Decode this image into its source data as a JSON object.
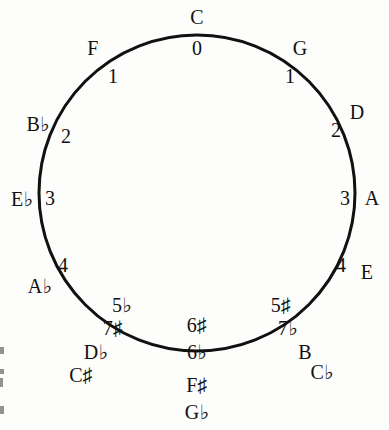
{
  "diagram": {
    "stroke_color": "#111111",
    "background_color": "#fdfdfb",
    "circle": {
      "center_x": 197,
      "center_y": 193,
      "radius": 158,
      "stroke_width": 3
    },
    "outer_labels": [
      {
        "text": "C",
        "x": 197,
        "y": 17,
        "name": "key-c"
      },
      {
        "text": "G",
        "x": 300,
        "y": 48,
        "name": "key-g"
      },
      {
        "text": "D",
        "x": 357,
        "y": 112,
        "name": "key-d"
      },
      {
        "text": "A",
        "x": 372,
        "y": 198,
        "name": "key-a"
      },
      {
        "text": "E",
        "x": 367,
        "y": 272,
        "name": "key-e"
      },
      {
        "text": "B",
        "x": 305,
        "y": 352,
        "name": "key-b"
      },
      {
        "text": "C♭",
        "x": 322,
        "y": 372,
        "name": "key-c-flat"
      },
      {
        "text": "F♯",
        "x": 197,
        "y": 385,
        "name": "key-f-sharp"
      },
      {
        "text": "G♭",
        "x": 197,
        "y": 412,
        "name": "key-g-flat"
      },
      {
        "text": "D♭",
        "x": 96,
        "y": 352,
        "name": "key-d-flat"
      },
      {
        "text": "C♯",
        "x": 81,
        "y": 375,
        "name": "key-c-sharp"
      },
      {
        "text": "A♭",
        "x": 40,
        "y": 286,
        "name": "key-a-flat"
      },
      {
        "text": "E♭",
        "x": 22,
        "y": 199,
        "name": "key-e-flat"
      },
      {
        "text": "B♭",
        "x": 38,
        "y": 124,
        "name": "key-b-flat"
      },
      {
        "text": "F",
        "x": 93,
        "y": 48,
        "name": "key-f"
      }
    ],
    "inner_labels": [
      {
        "text": "0",
        "x": 197,
        "y": 48,
        "name": "accidentals-0"
      },
      {
        "text": "1",
        "x": 290,
        "y": 76,
        "name": "accidentals-1-sharp"
      },
      {
        "text": "2",
        "x": 336,
        "y": 130,
        "name": "accidentals-2-sharp"
      },
      {
        "text": "3",
        "x": 345,
        "y": 198,
        "name": "accidentals-3-sharp"
      },
      {
        "text": "4",
        "x": 341,
        "y": 265,
        "name": "accidentals-4-sharp"
      },
      {
        "text": "5♯",
        "x": 281,
        "y": 305,
        "name": "accidentals-5-sharp"
      },
      {
        "text": "7♭",
        "x": 288,
        "y": 328,
        "name": "accidentals-7-flat"
      },
      {
        "text": "6♯",
        "x": 197,
        "y": 325,
        "name": "accidentals-6-sharp"
      },
      {
        "text": "6♭",
        "x": 197,
        "y": 352,
        "name": "accidentals-6-flat"
      },
      {
        "text": "5♭",
        "x": 122,
        "y": 305,
        "name": "accidentals-5-flat"
      },
      {
        "text": "7♯",
        "x": 113,
        "y": 328,
        "name": "accidentals-7-sharp"
      },
      {
        "text": "4",
        "x": 63,
        "y": 265,
        "name": "accidentals-4-flat"
      },
      {
        "text": "3",
        "x": 50,
        "y": 198,
        "name": "accidentals-3-flat"
      },
      {
        "text": "2",
        "x": 66,
        "y": 136,
        "name": "accidentals-2-flat"
      },
      {
        "text": "1",
        "x": 113,
        "y": 76,
        "name": "accidentals-1-flat"
      }
    ],
    "edge_artifacts": [
      {
        "y": 347,
        "w": 4,
        "h": 7
      },
      {
        "y": 369,
        "w": 4,
        "h": 5
      },
      {
        "y": 378,
        "w": 3,
        "h": 9
      },
      {
        "y": 406,
        "w": 4,
        "h": 8
      }
    ]
  }
}
